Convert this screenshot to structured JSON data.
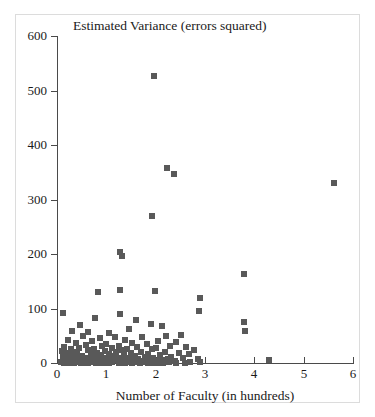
{
  "chart_data": {
    "type": "scatter",
    "title": "Estimated Variance (errors squared)",
    "xlabel": "Number of Faculty (in hundreds)",
    "ylabel": "",
    "xlim": [
      0,
      6
    ],
    "ylim": [
      0,
      600
    ],
    "xticks": [
      0,
      1,
      2,
      3,
      4,
      5,
      6
    ],
    "yticks": [
      0,
      100,
      200,
      300,
      400,
      500,
      600
    ],
    "xtick_labels": [
      "0",
      "1",
      "2",
      "3",
      "4",
      "5",
      "6"
    ],
    "ytick_labels": [
      "0",
      "100",
      "200",
      "300",
      "400",
      "500",
      "600"
    ],
    "grid": false,
    "legend": null,
    "marker": "square",
    "marker_color": "#595959",
    "marker_size_px": 6,
    "points": [
      [
        1.97,
        527
      ],
      [
        2.22,
        358
      ],
      [
        2.38,
        347
      ],
      [
        5.62,
        330
      ],
      [
        1.93,
        270
      ],
      [
        1.28,
        204
      ],
      [
        1.32,
        196
      ],
      [
        3.8,
        163
      ],
      [
        1.28,
        134
      ],
      [
        1.98,
        133
      ],
      [
        0.83,
        130
      ],
      [
        2.9,
        120
      ],
      [
        0.12,
        92
      ],
      [
        2.88,
        96
      ],
      [
        1.27,
        90
      ],
      [
        0.78,
        82
      ],
      [
        1.6,
        78
      ],
      [
        3.8,
        75
      ],
      [
        0.46,
        70
      ],
      [
        1.9,
        72
      ],
      [
        2.12,
        67
      ],
      [
        1.45,
        62
      ],
      [
        3.82,
        58
      ],
      [
        0.3,
        58
      ],
      [
        0.62,
        57
      ],
      [
        1.05,
        55
      ],
      [
        2.52,
        52
      ],
      [
        2.2,
        50
      ],
      [
        0.52,
        50
      ],
      [
        1.72,
        48
      ],
      [
        1.18,
        47
      ],
      [
        0.88,
        45
      ],
      [
        0.22,
        43
      ],
      [
        1.38,
        42
      ],
      [
        2.05,
        40
      ],
      [
        0.7,
        40
      ],
      [
        2.42,
        38
      ],
      [
        1.52,
        37
      ],
      [
        0.38,
        36
      ],
      [
        1.0,
        35
      ],
      [
        1.82,
        34
      ],
      [
        0.58,
        33
      ],
      [
        2.3,
        32
      ],
      [
        1.25,
        32
      ],
      [
        0.92,
        31
      ],
      [
        0.15,
        30
      ],
      [
        1.62,
        30
      ],
      [
        2.62,
        29
      ],
      [
        0.45,
        28
      ],
      [
        1.12,
        28
      ],
      [
        2.0,
        27
      ],
      [
        0.75,
        26
      ],
      [
        1.42,
        26
      ],
      [
        0.28,
        25
      ],
      [
        1.92,
        25
      ],
      [
        2.78,
        24
      ],
      [
        0.62,
        24
      ],
      [
        1.32,
        23
      ],
      [
        0.1,
        22
      ],
      [
        0.98,
        22
      ],
      [
        1.7,
        21
      ],
      [
        2.18,
        21
      ],
      [
        0.4,
        20
      ],
      [
        1.2,
        20
      ],
      [
        0.82,
        19
      ],
      [
        2.48,
        19
      ],
      [
        1.5,
        18
      ],
      [
        0.2,
        18
      ],
      [
        1.05,
        17
      ],
      [
        0.68,
        17
      ],
      [
        1.85,
        16
      ],
      [
        2.68,
        16
      ],
      [
        0.32,
        15
      ],
      [
        1.35,
        15
      ],
      [
        0.9,
        14
      ],
      [
        2.08,
        14
      ],
      [
        0.5,
        13
      ],
      [
        1.58,
        13
      ],
      [
        0.12,
        12
      ],
      [
        1.15,
        12
      ],
      [
        0.72,
        12
      ],
      [
        2.32,
        11
      ],
      [
        0.42,
        11
      ],
      [
        1.78,
        11
      ],
      [
        0.95,
        10
      ],
      [
        1.45,
        10
      ],
      [
        2.55,
        10
      ],
      [
        0.25,
        9
      ],
      [
        0.6,
        9
      ],
      [
        1.28,
        9
      ],
      [
        1.95,
        9
      ],
      [
        0.85,
        8
      ],
      [
        0.35,
        8
      ],
      [
        1.65,
        8
      ],
      [
        2.25,
        8
      ],
      [
        0.52,
        7
      ],
      [
        1.08,
        7
      ],
      [
        1.4,
        7
      ],
      [
        2.85,
        7
      ],
      [
        0.15,
        6
      ],
      [
        0.78,
        6
      ],
      [
        1.55,
        6
      ],
      [
        2.12,
        6
      ],
      [
        0.45,
        5
      ],
      [
        1.22,
        5
      ],
      [
        1.88,
        5
      ],
      [
        4.3,
        5
      ],
      [
        0.3,
        4
      ],
      [
        0.95,
        4
      ],
      [
        1.7,
        4
      ],
      [
        2.4,
        4
      ],
      [
        0.65,
        3
      ],
      [
        1.32,
        3
      ],
      [
        2.02,
        3
      ],
      [
        0.18,
        3
      ],
      [
        1.48,
        2
      ],
      [
        0.88,
        2
      ],
      [
        2.7,
        2
      ],
      [
        0.55,
        2
      ],
      [
        1.78,
        1
      ],
      [
        1.12,
        1
      ],
      [
        2.28,
        1
      ],
      [
        0.38,
        1
      ],
      [
        0.72,
        1
      ],
      [
        1.6,
        1
      ],
      [
        2.9,
        1
      ],
      [
        0.08,
        1
      ],
      [
        1.02,
        0
      ],
      [
        0.48,
        0
      ],
      [
        1.38,
        0
      ],
      [
        2.15,
        0
      ],
      [
        0.25,
        0
      ],
      [
        0.92,
        0
      ],
      [
        1.85,
        0
      ],
      [
        2.6,
        0
      ],
      [
        0.62,
        0
      ],
      [
        1.25,
        0
      ],
      [
        0.35,
        0
      ],
      [
        1.95,
        0
      ],
      [
        0.8,
        0
      ],
      [
        1.52,
        0
      ],
      [
        2.42,
        0
      ],
      [
        0.52,
        0
      ],
      [
        1.68,
        0
      ],
      [
        1.05,
        0
      ],
      [
        0.14,
        0
      ],
      [
        2.05,
        0
      ]
    ]
  }
}
